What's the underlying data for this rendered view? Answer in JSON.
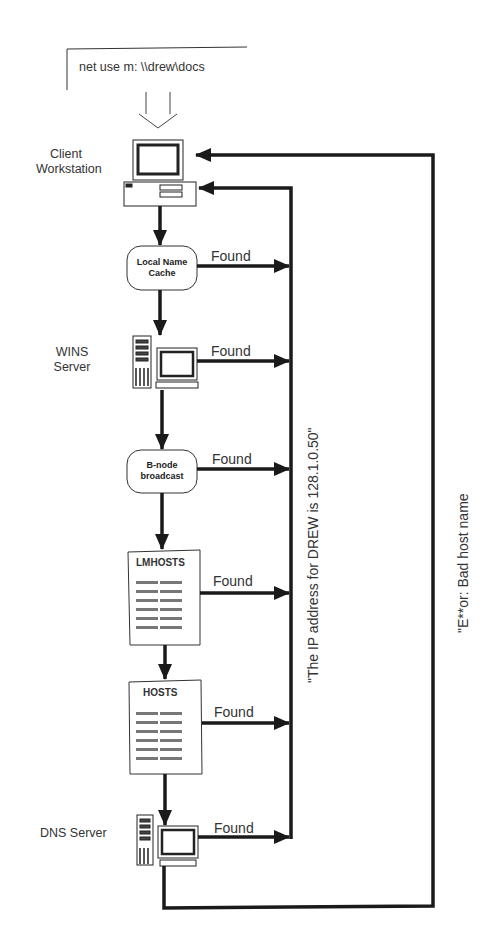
{
  "diagram": {
    "command": "net use m: \\\\drew\\docs",
    "nodes": [
      {
        "id": "client",
        "label_line1": "Client",
        "label_line2": "Workstation",
        "type": "workstation"
      },
      {
        "id": "cache",
        "inner_line1": "Local Name",
        "inner_line2": "Cache",
        "type": "rounded-box"
      },
      {
        "id": "wins",
        "label_line1": "WINS",
        "label_line2": "Server",
        "type": "server"
      },
      {
        "id": "bnode",
        "inner_line1": "B-node",
        "inner_line2": "broadcast",
        "type": "rounded-box"
      },
      {
        "id": "lmhosts",
        "title": "LMHOSTS",
        "type": "document"
      },
      {
        "id": "hosts",
        "title": "HOSTS",
        "type": "document"
      },
      {
        "id": "dns",
        "label": "DNS Server",
        "type": "server"
      }
    ],
    "found_label": "Found",
    "success_message": "\"The IP address for  DREW is 128.1.0.50\"",
    "error_message": "\"E**or: Bad host name",
    "colors": {
      "line": "#1a1a1a",
      "text": "#333333",
      "background": "#ffffff"
    }
  }
}
